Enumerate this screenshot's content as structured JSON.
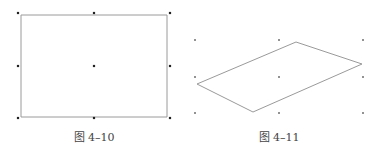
{
  "figures": [
    {
      "id": "fig-4-10",
      "caption": "图 4–10",
      "shape": "rectangle",
      "outline": [
        [
          21,
          15
        ],
        [
          167,
          15
        ],
        [
          167,
          117
        ],
        [
          21,
          117
        ]
      ],
      "handles": [
        [
          18,
          13
        ],
        [
          94,
          13
        ],
        [
          170,
          13
        ],
        [
          18,
          66
        ],
        [
          94,
          66
        ],
        [
          170,
          66
        ],
        [
          18,
          118
        ],
        [
          94,
          118
        ],
        [
          170,
          118
        ]
      ],
      "caption_pos": [
        94,
        128
      ]
    },
    {
      "id": "fig-4-11",
      "caption": "图 4–11",
      "shape": "parallelogram",
      "outline": [
        [
          197,
          84
        ],
        [
          296,
          42
        ],
        [
          362,
          64
        ],
        [
          253,
          112
        ]
      ],
      "handles": [
        [
          195,
          40
        ],
        [
          279,
          40
        ],
        [
          363,
          40
        ],
        [
          195,
          77
        ],
        [
          279,
          77
        ],
        [
          363,
          77
        ],
        [
          195,
          113
        ],
        [
          279,
          113
        ],
        [
          363,
          113
        ]
      ],
      "caption_pos": [
        279,
        128
      ]
    }
  ],
  "colors": {
    "outline": "#9a9a9a",
    "handle": "#222222",
    "caption": "#444444"
  }
}
